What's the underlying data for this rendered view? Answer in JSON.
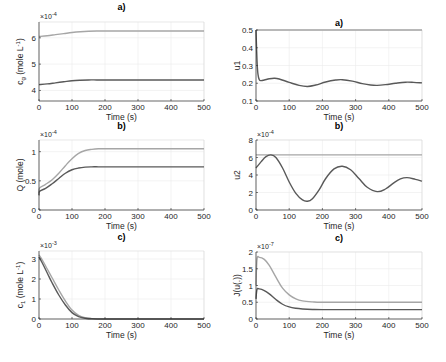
{
  "chart_data": [
    {
      "id": "cg",
      "type": "line",
      "title": "a)",
      "xlabel": "Time (s)",
      "ylabel": "c_g (mole L^-1)",
      "ylabel_main": "c",
      "ylabel_sub": "g",
      "ylabel_rest": " (mole L",
      "ylabel_sup": "-1",
      "ylabel_end": ")",
      "y_exponent": "×10^-4",
      "exp_base": "×10",
      "exp_pow": "-4",
      "xlim": [
        0,
        500
      ],
      "ylim": [
        3.6,
        6.6
      ],
      "xticks": [
        0,
        100,
        200,
        300,
        400,
        500
      ],
      "yticks": [
        4,
        5,
        6
      ],
      "grid": true,
      "x": [
        0,
        25,
        50,
        75,
        100,
        125,
        150,
        175,
        200,
        250,
        300,
        350,
        400,
        450,
        500
      ],
      "series": [
        {
          "name": "upper",
          "color": "#a6a6a6",
          "values": [
            6.05,
            6.08,
            6.12,
            6.16,
            6.2,
            6.23,
            6.25,
            6.26,
            6.26,
            6.26,
            6.26,
            6.26,
            6.26,
            6.26,
            6.26
          ]
        },
        {
          "name": "lower",
          "color": "#595959",
          "values": [
            4.22,
            4.25,
            4.29,
            4.33,
            4.37,
            4.39,
            4.4,
            4.4,
            4.4,
            4.4,
            4.4,
            4.4,
            4.4,
            4.4,
            4.4
          ]
        }
      ]
    },
    {
      "id": "u1",
      "type": "line",
      "title": "a)",
      "xlabel": "Time (s)",
      "ylabel": "u1",
      "xlim": [
        0,
        500
      ],
      "ylim": [
        0.1,
        0.5
      ],
      "xticks": [
        0,
        100,
        200,
        300,
        400,
        500
      ],
      "yticks": [
        0.1,
        0.2,
        0.3,
        0.4,
        0.5
      ],
      "ytick_labels": [
        "0.1",
        "0.2",
        "0.3",
        "0.4",
        "0.5"
      ],
      "grid": true,
      "x": [
        0,
        3,
        6,
        10,
        15,
        25,
        40,
        55,
        70,
        100,
        130,
        155,
        180,
        210,
        240,
        260,
        290,
        320,
        345,
        365,
        390,
        420,
        450,
        475,
        500
      ],
      "series": [
        {
          "name": "reference",
          "color": "#a6a6a6",
          "values": [
            0.5,
            0.5,
            0.5,
            0.5,
            0.5,
            0.5,
            0.5,
            0.5,
            0.5,
            0.5,
            0.5,
            0.5,
            0.5,
            0.5,
            0.5,
            0.5,
            0.5,
            0.5,
            0.5,
            0.5,
            0.5,
            0.5,
            0.5,
            0.5,
            0.5
          ]
        },
        {
          "name": "u1",
          "color": "#595959",
          "values": [
            0.5,
            0.33,
            0.25,
            0.22,
            0.215,
            0.218,
            0.225,
            0.228,
            0.224,
            0.205,
            0.188,
            0.182,
            0.19,
            0.207,
            0.218,
            0.22,
            0.212,
            0.198,
            0.19,
            0.188,
            0.192,
            0.2,
            0.206,
            0.205,
            0.202
          ]
        }
      ]
    },
    {
      "id": "Q",
      "type": "line",
      "title": "b)",
      "xlabel": "Time (s)",
      "ylabel": "Q (mole)",
      "y_exponent": "×10^-4",
      "exp_base": "×10",
      "exp_pow": "-4",
      "xlim": [
        0,
        500
      ],
      "ylim": [
        0,
        1.2
      ],
      "xticks": [
        0,
        100,
        200,
        300,
        400,
        500
      ],
      "yticks": [
        0,
        0.5,
        1
      ],
      "ytick_labels": [
        "0",
        "0.5",
        "1"
      ],
      "grid": true,
      "x": [
        0,
        2,
        20,
        40,
        60,
        80,
        100,
        120,
        140,
        160,
        180,
        200,
        250,
        300,
        400,
        500
      ],
      "series": [
        {
          "name": "upper",
          "color": "#a6a6a6",
          "values": [
            0.3,
            0.38,
            0.44,
            0.52,
            0.63,
            0.76,
            0.88,
            0.97,
            1.02,
            1.04,
            1.05,
            1.05,
            1.05,
            1.05,
            1.05,
            1.05
          ]
        },
        {
          "name": "lower",
          "color": "#595959",
          "values": [
            0.25,
            0.32,
            0.37,
            0.45,
            0.54,
            0.63,
            0.69,
            0.72,
            0.735,
            0.74,
            0.74,
            0.74,
            0.74,
            0.74,
            0.74,
            0.74
          ]
        }
      ]
    },
    {
      "id": "u2",
      "type": "line",
      "title": "b)",
      "xlabel": "Time (s)",
      "ylabel": "u2",
      "y_exponent": "×10^-4",
      "exp_base": "×10",
      "exp_pow": "-4",
      "xlim": [
        0,
        500
      ],
      "ylim": [
        0,
        8
      ],
      "xticks": [
        0,
        100,
        200,
        300,
        400,
        500
      ],
      "yticks": [
        0,
        2,
        4,
        6,
        8
      ],
      "ytick_labels": [
        "0",
        "2",
        "4",
        "6",
        "8"
      ],
      "grid": true,
      "x": [
        0,
        15,
        30,
        45,
        60,
        80,
        100,
        120,
        140,
        155,
        170,
        190,
        210,
        235,
        260,
        285,
        310,
        335,
        365,
        390,
        415,
        435,
        455,
        480,
        500
      ],
      "series": [
        {
          "name": "reference",
          "color": "#a6a6a6",
          "values": [
            6.3,
            6.3,
            6.3,
            6.3,
            6.3,
            6.3,
            6.3,
            6.3,
            6.3,
            6.3,
            6.3,
            6.3,
            6.3,
            6.3,
            6.3,
            6.3,
            6.3,
            6.3,
            6.3,
            6.3,
            6.3,
            6.3,
            6.3,
            6.3,
            6.3
          ]
        },
        {
          "name": "u2",
          "color": "#595959",
          "values": [
            4.8,
            5.5,
            6.1,
            6.3,
            6.0,
            4.8,
            3.2,
            1.9,
            1.15,
            1.0,
            1.3,
            2.3,
            3.6,
            4.7,
            5.0,
            4.6,
            3.6,
            2.6,
            2.1,
            2.4,
            3.1,
            3.55,
            3.7,
            3.5,
            3.3
          ]
        }
      ]
    },
    {
      "id": "c1",
      "type": "line",
      "title": "c)",
      "xlabel": "Time (s)",
      "ylabel": "c_1 (mole L^-1)",
      "ylabel_main": "c",
      "ylabel_sub": "1",
      "ylabel_rest": " (mole L",
      "ylabel_sup": "-1",
      "ylabel_end": ")",
      "y_exponent": "×10^-3",
      "exp_base": "×10",
      "exp_pow": "-3",
      "xlim": [
        0,
        500
      ],
      "ylim": [
        0,
        3.4
      ],
      "xticks": [
        0,
        100,
        200,
        300,
        400,
        500
      ],
      "yticks": [
        0,
        1,
        2,
        3
      ],
      "ytick_labels": [
        "0",
        "1",
        "2",
        "3"
      ],
      "grid": true,
      "x": [
        0,
        10,
        25,
        40,
        60,
        80,
        100,
        120,
        140,
        160,
        200,
        300,
        400,
        500
      ],
      "series": [
        {
          "name": "upper",
          "color": "#a6a6a6",
          "values": [
            3.2,
            2.95,
            2.5,
            2.05,
            1.45,
            0.9,
            0.45,
            0.18,
            0.06,
            0.02,
            0,
            0,
            0,
            0
          ]
        },
        {
          "name": "lower",
          "color": "#595959",
          "values": [
            3.1,
            2.8,
            2.3,
            1.8,
            1.2,
            0.7,
            0.32,
            0.12,
            0.04,
            0.01,
            0,
            0,
            0,
            0
          ]
        }
      ]
    },
    {
      "id": "J",
      "type": "line",
      "title": "c)",
      "xlabel": "Time (s)",
      "ylabel": "J(u(.))",
      "y_exponent": "×10^-7",
      "exp_base": "×10",
      "exp_pow": "-7",
      "xlim": [
        0,
        500
      ],
      "ylim": [
        0,
        2
      ],
      "xticks": [
        0,
        100,
        200,
        300,
        400,
        500
      ],
      "yticks": [
        0,
        0.5,
        1,
        1.5,
        2
      ],
      "ytick_labels": [
        "0",
        "0.5",
        "1",
        "1.5",
        "2"
      ],
      "grid": true,
      "x": [
        0,
        3,
        10,
        25,
        40,
        60,
        80,
        100,
        120,
        140,
        170,
        200,
        300,
        400,
        500
      ],
      "series": [
        {
          "name": "upper",
          "color": "#a6a6a6",
          "values": [
            1.0,
            1.78,
            1.84,
            1.78,
            1.6,
            1.25,
            0.92,
            0.72,
            0.6,
            0.54,
            0.51,
            0.5,
            0.5,
            0.5,
            0.5
          ]
        },
        {
          "name": "lower",
          "color": "#595959",
          "values": [
            0.6,
            0.88,
            0.9,
            0.85,
            0.75,
            0.58,
            0.44,
            0.36,
            0.32,
            0.3,
            0.285,
            0.28,
            0.28,
            0.28,
            0.28
          ]
        }
      ]
    }
  ],
  "layout": {
    "panels": [
      {
        "id": "cg",
        "x0": 39,
        "x1": 204,
        "y0": 22,
        "y1": 101
      },
      {
        "id": "u1",
        "x0": 256,
        "x1": 422,
        "y0": 30,
        "y1": 101
      },
      {
        "id": "Q",
        "x0": 39,
        "x1": 204,
        "y0": 140,
        "y1": 210
      },
      {
        "id": "u2",
        "x0": 256,
        "x1": 422,
        "y0": 140,
        "y1": 210
      },
      {
        "id": "c1",
        "x0": 39,
        "x1": 204,
        "y0": 251,
        "y1": 319
      },
      {
        "id": "J",
        "x0": 256,
        "x1": 422,
        "y0": 252,
        "y1": 319
      }
    ]
  }
}
